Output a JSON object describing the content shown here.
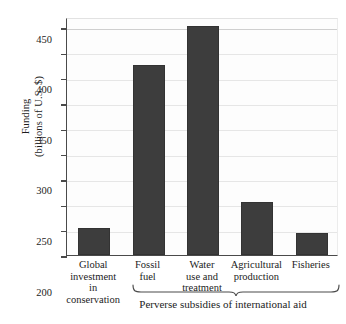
{
  "chart_data": {
    "type": "bar",
    "title": "",
    "xlabel": "",
    "ylabel": "Funding\n(billions of U.S. $)",
    "ylim": [
      0,
      470
    ],
    "yticks": [
      0,
      50,
      100,
      150,
      200,
      250,
      300,
      350,
      400,
      450
    ],
    "ytick_labels": [
      "0",
      "50",
      "100",
      "150",
      "200",
      "250",
      "300",
      "350",
      "400",
      "450"
    ],
    "grid": true,
    "legend": "none",
    "categories": [
      "Global\ninvestment\nin\nconservation",
      "Fossil\nfuel",
      "Water\nuse and\ntreatment",
      "Agricultural\nproduction",
      "Fisheries"
    ],
    "values": [
      53,
      375,
      453,
      105,
      43
    ],
    "bar_color": "#3d3d3d",
    "annotations": [
      {
        "type": "group-bracket",
        "label": "Perverse subsidies of international aid",
        "covers": [
          "Fossil fuel",
          "Water use and treatment",
          "Agricultural production",
          "Fisheries"
        ]
      }
    ]
  },
  "axis": {
    "y_title": "Funding\n(billions of U.S. $)"
  },
  "bracket": {
    "caption": "Perverse subsidies of international aid"
  }
}
